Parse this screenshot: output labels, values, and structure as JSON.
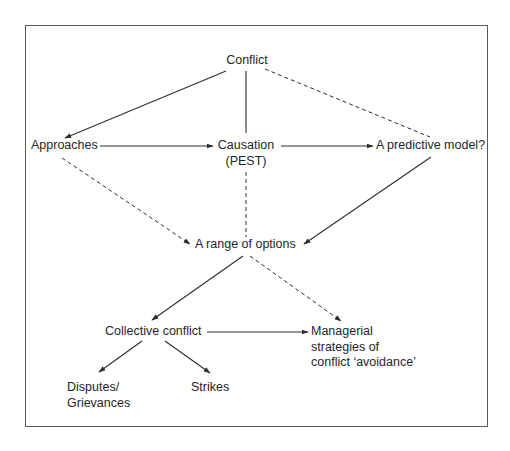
{
  "diagram": {
    "type": "flowchart",
    "colors": {
      "text": "#262626",
      "line": "#2e2e2e",
      "frame": "#5a5a5a",
      "background": "#ffffff"
    },
    "nodes": {
      "conflict": {
        "label": "Conflict"
      },
      "approaches": {
        "label": "Approaches"
      },
      "causation": {
        "line1": "Causation",
        "line2": "(PEST)"
      },
      "predictive_model": {
        "label": "A predictive model?"
      },
      "range_of_options": {
        "label": "A range of options"
      },
      "collective_conflict": {
        "label": "Collective conflict"
      },
      "managerial_strategies": {
        "line1": "Managerial",
        "line2": "strategies of",
        "line3": "conflict ‘avoidance’"
      },
      "disputes_grievances": {
        "line1": "Disputes/",
        "line2": "Grievances"
      },
      "strikes": {
        "label": "Strikes"
      }
    },
    "edges": [
      {
        "from": "conflict",
        "to": "approaches",
        "style": "solid",
        "arrow": true
      },
      {
        "from": "conflict",
        "to": "causation",
        "style": "solid",
        "arrow": false
      },
      {
        "from": "conflict",
        "to": "predictive_model",
        "style": "dashed",
        "arrow": false
      },
      {
        "from": "approaches",
        "to": "causation",
        "style": "solid",
        "arrow": true
      },
      {
        "from": "causation",
        "to": "predictive_model",
        "style": "solid",
        "arrow": true
      },
      {
        "from": "approaches",
        "to": "range_of_options",
        "style": "dashed",
        "arrow": true
      },
      {
        "from": "causation",
        "to": "range_of_options",
        "style": "dashed",
        "arrow": false
      },
      {
        "from": "predictive_model",
        "to": "range_of_options",
        "style": "solid",
        "arrow": true
      },
      {
        "from": "range_of_options",
        "to": "collective_conflict",
        "style": "solid",
        "arrow": true
      },
      {
        "from": "range_of_options",
        "to": "managerial_strategies",
        "style": "dashed",
        "arrow": true
      },
      {
        "from": "collective_conflict",
        "to": "managerial_strategies",
        "style": "solid",
        "arrow": true
      },
      {
        "from": "collective_conflict",
        "to": "disputes_grievances",
        "style": "solid",
        "arrow": true
      },
      {
        "from": "collective_conflict",
        "to": "strikes",
        "style": "solid",
        "arrow": true
      }
    ]
  }
}
